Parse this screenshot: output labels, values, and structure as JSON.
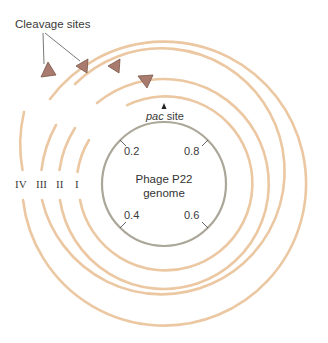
{
  "figure": {
    "title_label": "Cleavage sites",
    "pac_label_italic": "pac",
    "pac_label_rest": " site",
    "genome_label_line1": "Phage P22",
    "genome_label_line2": "genome",
    "genome_ticks": [
      {
        "label": "0.2",
        "position": "upper-left"
      },
      {
        "label": "0.8",
        "position": "upper-right"
      },
      {
        "label": "0.4",
        "position": "lower-left"
      },
      {
        "label": "0.6",
        "position": "lower-right"
      }
    ],
    "rings": [
      {
        "label": "I",
        "radius": 87
      },
      {
        "label": "II",
        "radius": 105
      },
      {
        "label": "III",
        "radius": 123
      },
      {
        "label": "IV",
        "radius": 142
      }
    ],
    "colors": {
      "ring": "#ebc7a2",
      "genome_circle": "#aaa698",
      "cleavage_marker": "#a87b6e",
      "cleavage_marker_border": "#7a5548",
      "text": "#333333"
    }
  }
}
